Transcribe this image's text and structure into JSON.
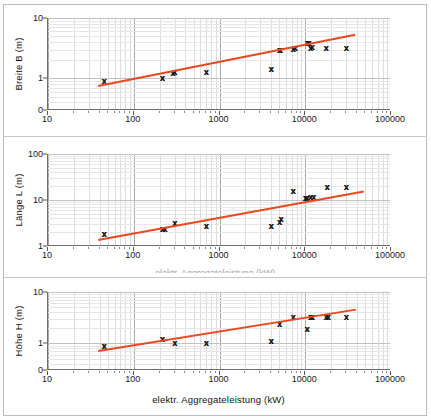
{
  "figure": {
    "xlabel": "elektr. Aggregateleistung  (kW)",
    "clipped_label": "elektr. Aggregateleistung  (kW)",
    "accent_color": "#e8491f",
    "marker_glyph": "x",
    "marker_color": "#1a1a1a",
    "axis_color": "#6e6e6e",
    "x_ticks": [
      "10",
      "100",
      "1000",
      "10000",
      "100000"
    ]
  },
  "chart_data": [
    {
      "type": "scatter",
      "title": "",
      "xlabel": "",
      "ylabel": "Breite  B   (m)",
      "xscale": "log",
      "yscale": "log",
      "xlim": [
        10,
        100000
      ],
      "ylim": [
        0.3,
        10
      ],
      "grid": true,
      "x_tick_labels": [
        "10",
        "100",
        "1000",
        "10000",
        "100000"
      ],
      "y_tick_labels": [
        "10",
        "1",
        "0"
      ],
      "y_tick_values": [
        10,
        1,
        0.3
      ],
      "legend": "none",
      "series": [
        {
          "name": "Breite B",
          "x": [
            45,
            215,
            285,
            300,
            700,
            4000,
            5000,
            5100,
            7200,
            7600,
            10500,
            11000,
            11500,
            12000,
            17500,
            30000
          ],
          "y": [
            0.9,
            1.0,
            1.25,
            1.3,
            1.3,
            1.45,
            2.9,
            2.95,
            3.1,
            3.15,
            3.8,
            3.9,
            3.2,
            3.3,
            3.2,
            3.2
          ]
        },
        {
          "name": "trend",
          "type": "line",
          "x": [
            38,
            38000
          ],
          "y": [
            0.78,
            5.5
          ]
        }
      ]
    },
    {
      "type": "scatter",
      "title": "",
      "xlabel": "",
      "ylabel": "Länge L  (m)",
      "xscale": "log",
      "yscale": "log",
      "xlim": [
        10,
        100000
      ],
      "ylim": [
        1,
        100
      ],
      "grid": true,
      "x_tick_labels": [
        "10",
        "100",
        "1000",
        "10000",
        "100000"
      ],
      "y_tick_labels": [
        "100",
        "10",
        "1"
      ],
      "y_tick_values": [
        100,
        10,
        1
      ],
      "legend": "none",
      "series": [
        {
          "name": "Länge L",
          "x": [
            45,
            215,
            230,
            300,
            700,
            4000,
            5000,
            5200,
            7200,
            10000,
            10500,
            11500,
            12500,
            18000,
            30000
          ],
          "y": [
            1.8,
            2.3,
            2.4,
            3.1,
            2.7,
            2.7,
            3.4,
            3.9,
            15.5,
            10.8,
            11.2,
            11.5,
            11.8,
            19.0,
            19.5
          ]
        },
        {
          "name": "trend",
          "type": "line",
          "x": [
            38,
            48000
          ],
          "y": [
            1.45,
            16.5
          ]
        }
      ]
    },
    {
      "type": "scatter",
      "title": "",
      "xlabel": "elektr. Aggregateleistung  (kW)",
      "ylabel": "Höhe  H   (m)",
      "xscale": "log",
      "yscale": "log",
      "xlim": [
        10,
        100000
      ],
      "ylim": [
        0.3,
        10
      ],
      "grid": true,
      "x_tick_labels": [
        "10",
        "100",
        "1000",
        "10000",
        "100000"
      ],
      "y_tick_labels": [
        "10",
        "1",
        "0"
      ],
      "y_tick_values": [
        10,
        1,
        0.3
      ],
      "legend": "none",
      "series": [
        {
          "name": "Höhe H",
          "x": [
            45,
            215,
            300,
            700,
            4000,
            5000,
            7200,
            10500,
            11500,
            12000,
            17500,
            18500,
            30000
          ],
          "y": [
            0.88,
            1.2,
            1.0,
            1.0,
            1.1,
            2.4,
            3.3,
            1.9,
            3.2,
            3.3,
            3.2,
            3.25,
            3.3
          ]
        },
        {
          "name": "trend",
          "type": "line",
          "x": [
            38,
            38000
          ],
          "y": [
            0.75,
            4.8
          ]
        }
      ]
    }
  ]
}
